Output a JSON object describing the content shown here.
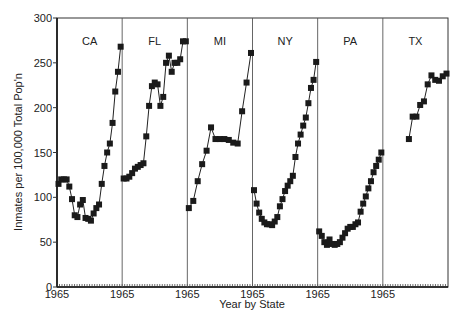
{
  "chart_data": {
    "type": "scatter",
    "title": "",
    "xlabel": "Year by State",
    "ylabel": "Inmates per 100,000 Total Pop'n",
    "ylim": [
      0,
      300
    ],
    "yticks": [
      0,
      50,
      100,
      150,
      200,
      250,
      300
    ],
    "xtick_label": "1965",
    "grid": false,
    "legend": null,
    "panels": [
      {
        "state": "CA",
        "values": [
          115,
          120,
          120,
          120,
          112,
          98,
          80,
          78,
          92,
          97,
          77,
          76,
          74,
          82,
          88,
          92,
          115,
          135,
          150,
          160,
          183,
          218,
          240,
          268
        ]
      },
      {
        "state": "FL",
        "values": [
          121,
          121,
          123,
          127,
          132,
          134,
          136,
          138,
          168,
          202,
          224,
          228,
          226,
          202,
          212,
          250,
          258,
          240,
          250,
          250,
          254,
          274,
          274
        ]
      },
      {
        "state": "MI",
        "values": [
          88,
          96,
          118,
          137,
          152,
          178,
          165,
          165,
          165,
          164,
          161,
          160,
          196,
          228,
          261
        ]
      },
      {
        "state": "NY",
        "values": [
          108,
          93,
          83,
          76,
          72,
          70,
          70,
          69,
          73,
          78,
          90,
          98,
          107,
          113,
          118,
          124,
          145,
          160,
          170,
          180,
          189,
          205,
          222,
          231,
          251
        ]
      },
      {
        "state": "PA",
        "values": [
          62,
          57,
          50,
          47,
          53,
          48,
          47,
          48,
          50,
          55,
          60,
          65,
          67,
          67,
          70,
          72,
          84,
          93,
          101,
          110,
          118,
          128,
          135,
          142,
          150
        ]
      },
      {
        "state": "TX",
        "values": [
          165,
          190,
          190,
          203,
          207,
          226,
          236,
          231,
          230,
          235,
          238
        ]
      }
    ]
  },
  "labels": {
    "ylabel": "Inmates per 100,000 Total Pop'n",
    "xlabel": "Year by State",
    "xtick": "1965",
    "states": [
      "CA",
      "FL",
      "MI",
      "NY",
      "PA",
      "TX"
    ]
  }
}
